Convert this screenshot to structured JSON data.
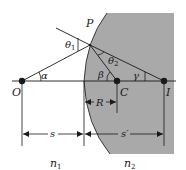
{
  "figure": {
    "type": "refraction-at-spherical-surface",
    "colors": {
      "medium2_fill": "#a9a9a9",
      "line": "#1a1a1a",
      "background": "#ffffff"
    },
    "points": {
      "object": "O",
      "center": "C",
      "image": "I",
      "incidence": "P"
    },
    "angles": {
      "incident": "θ",
      "incident_sub": "1",
      "refracted": "θ",
      "refracted_sub": "2",
      "alpha": "α",
      "beta": "β",
      "gamma": "γ"
    },
    "dimensions": {
      "radius": "R",
      "object_distance": "s",
      "image_distance": "s′"
    },
    "media": {
      "n1_base": "n",
      "n1_sub": "1",
      "n2_base": "n",
      "n2_sub": "2"
    }
  }
}
